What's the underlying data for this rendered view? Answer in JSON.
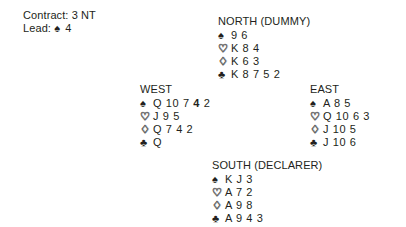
{
  "contract": {
    "contract_label": "Contract:",
    "contract_value": "3 NT",
    "contract_line": "Contract: 3 NT",
    "lead_label": "Lead:",
    "lead_suit_symbol": "♠",
    "lead_suit_name": "spade-icon",
    "lead_rank": "4",
    "lead_line": "Lead:"
  },
  "suit_order": [
    "spades",
    "hearts",
    "diamonds",
    "clubs"
  ],
  "suit_glyphs": {
    "spades": "♠",
    "hearts": "♡",
    "diamonds": "♢",
    "clubs": "♣"
  },
  "colors": {
    "text": "#231f20",
    "background": "#ffffff",
    "outline_suit_stroke": "#7a7a7a"
  },
  "hands": {
    "north": {
      "label": "NORTH (DUMMY)",
      "spades": "9 6",
      "hearts": "K 8 4",
      "diamonds": "K 6 3",
      "clubs": "K 8 7 5 2"
    },
    "west": {
      "label": "WEST",
      "spades_pre": "Q 10 7 ",
      "spades_lead": "4",
      "spades_post": " 2",
      "spades": "Q 10 7 4 2",
      "hearts": "J 9 5",
      "diamonds": "Q 7 4 2",
      "clubs": "Q"
    },
    "east": {
      "label": "EAST",
      "spades": "A 8 5",
      "hearts": "Q 10 6 3",
      "diamonds": "J 10 5",
      "clubs": "J 10 6"
    },
    "south": {
      "label": "SOUTH (DECLARER)",
      "spades": "K J 3",
      "hearts": "A 7 2",
      "diamonds": "A 9 8",
      "clubs": "A 9 4 3"
    }
  }
}
